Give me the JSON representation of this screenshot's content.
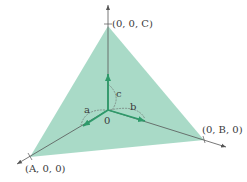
{
  "diagram": {
    "colors": {
      "plane_fill": "#8ccdb4",
      "axis": "#555555",
      "vector": "#2e9a6a",
      "arc": "#666666",
      "text": "#3a3a3a"
    },
    "points": {
      "C": "(0, 0, C)",
      "B": "(0, B, 0)",
      "A": "(A, 0, 0)",
      "origin": "0"
    },
    "vectors": {
      "a": "a",
      "b": "b",
      "c": "c"
    }
  }
}
